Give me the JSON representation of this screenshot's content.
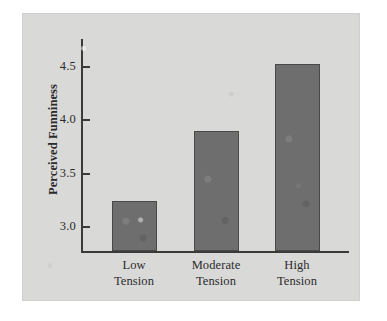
{
  "chart_data": {
    "type": "bar",
    "title": "",
    "subtitle": "",
    "xlabel": "",
    "ylabel": "Perceived Funniness",
    "categories": [
      "Low Tension",
      "Moderate Tension",
      "High Tension"
    ],
    "category_lines": [
      {
        "line1": "Low",
        "line2": "Tension"
      },
      {
        "line1": "Moderate",
        "line2": "Tension"
      },
      {
        "line1": "High",
        "line2": "Tension"
      }
    ],
    "values": [
      3.23,
      3.89,
      4.52
    ],
    "ylim": [
      2.77,
      4.62
    ],
    "yticks": [
      "3.0",
      "3.5",
      "4.0",
      "4.5"
    ],
    "ytick_values": [
      3.0,
      3.5,
      4.0,
      4.5
    ],
    "grid": false,
    "legend": false,
    "legend_position": "none",
    "bar_color": "#6e6e6e",
    "bar_edge_color": "#4a4a4a",
    "axis_color": "#3a3a3a",
    "panel_background": "#d9d9d8",
    "page_background": "#ffffff"
  }
}
